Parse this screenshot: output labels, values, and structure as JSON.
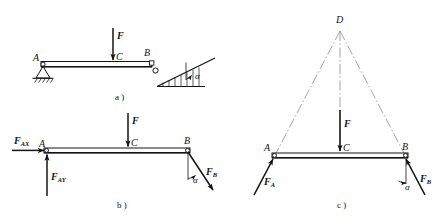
{
  "figure": {
    "stroke_color": "#1a1a1a",
    "construction_color": "#8a8a8a",
    "panels": [
      {
        "key": "a",
        "caption": "a )",
        "description": "Physical arrangement: beam AB, pin support at A on ground hatching, roller at B on incline of angle alpha, load F applied downward at midpoint C",
        "labels": {
          "A": "A",
          "B": "B",
          "C": "C",
          "F": "F",
          "alpha": "α"
        }
      },
      {
        "key": "b",
        "caption": "b )",
        "description": "Free-body diagram with pin reaction resolved into components F_AX horizontal and F_AY vertical, load F at C, and roller reaction F_B normal to incline at angle alpha from vertical",
        "labels": {
          "A": "A",
          "B": "B",
          "C": "C",
          "F": "F",
          "F_AX": "F",
          "F_AX_sub": "AX",
          "F_AY": "F",
          "F_AY_sub": "AY",
          "F_B": "F",
          "F_B_sub": "B",
          "alpha": "α"
        }
      },
      {
        "key": "c",
        "caption": "c )",
        "description": "Three-force member solution: lines of action of F_A, F and F_B concur at point D above the beam; construction lines shown dash-dot",
        "labels": {
          "A": "A",
          "B": "B",
          "C": "C",
          "D": "D",
          "F": "F",
          "F_A": "F",
          "F_A_sub": "A",
          "F_B": "F",
          "F_B_sub": "B",
          "alpha": "α"
        }
      }
    ]
  }
}
